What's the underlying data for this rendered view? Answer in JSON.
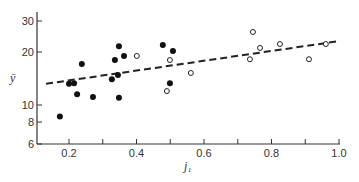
{
  "chart_data": {
    "type": "scatter",
    "title": "",
    "xlabel": "j₁",
    "ylabel": "ȳ",
    "xlim": [
      0.105,
      1.0
    ],
    "ylim": [
      6,
      35
    ],
    "yscale": "log",
    "grid": false,
    "x_ticks": [
      {
        "value": 0.2,
        "label": "0.2"
      },
      {
        "value": 0.3,
        "label": ""
      },
      {
        "value": 0.4,
        "label": "0.4"
      },
      {
        "value": 0.5,
        "label": ""
      },
      {
        "value": 0.6,
        "label": "0.6"
      },
      {
        "value": 0.7,
        "label": ""
      },
      {
        "value": 0.8,
        "label": "0.8"
      },
      {
        "value": 0.9,
        "label": ""
      },
      {
        "value": 1.0,
        "label": "1.0"
      }
    ],
    "y_ticks": [
      {
        "value": 6,
        "label": "6"
      },
      {
        "value": 8,
        "label": "8"
      },
      {
        "value": 10,
        "label": "10"
      },
      {
        "value": 20,
        "label": "20"
      },
      {
        "value": 30,
        "label": "30"
      }
    ],
    "series": [
      {
        "name": "filled",
        "marker": "filled-circle",
        "points": [
          [
            0.173,
            8.6
          ],
          [
            0.2,
            13.2
          ],
          [
            0.215,
            13.3
          ],
          [
            0.224,
            11.5
          ],
          [
            0.238,
            17.1
          ],
          [
            0.271,
            11.1
          ],
          [
            0.327,
            14.0
          ],
          [
            0.336,
            18.0
          ],
          [
            0.345,
            14.8
          ],
          [
            0.348,
            21.6
          ],
          [
            0.348,
            11.0
          ],
          [
            0.363,
            19.0
          ],
          [
            0.478,
            21.9
          ],
          [
            0.508,
            20.3
          ],
          [
            0.499,
            13.3
          ]
        ]
      },
      {
        "name": "open",
        "marker": "open-circle",
        "points": [
          [
            0.401,
            19.0
          ],
          [
            0.499,
            18.0
          ],
          [
            0.49,
            12.0
          ],
          [
            0.561,
            15.2
          ],
          [
            0.745,
            26.0
          ],
          [
            0.766,
            21.1
          ],
          [
            0.736,
            18.2
          ],
          [
            0.825,
            22.2
          ],
          [
            0.911,
            18.2
          ],
          [
            0.961,
            22.2
          ]
        ]
      },
      {
        "name": "fit",
        "style": "dashed-line",
        "points": [
          [
            0.132,
            13.2
          ],
          [
            1.003,
            23.1
          ]
        ]
      }
    ]
  }
}
